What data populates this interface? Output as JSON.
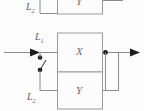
{
  "figure": {
    "type": "block-diagram",
    "background_color": "#fdfdfd",
    "line_color": "#8c8c8c",
    "box_border_color": "#9a9a9a",
    "box_fill_color": "#fcfcfc",
    "label_color": "#5a5a5a",
    "node_color": "#1c1c1c"
  },
  "blocks": [
    {
      "id": "top",
      "label": "Y",
      "note": "partially cropped block at top edge"
    },
    {
      "id": "middle",
      "label": "X",
      "note": "forward path block"
    },
    {
      "id": "bottom",
      "label": "Y",
      "note": "parallel feedback block"
    }
  ],
  "labels": {
    "top_branch": {
      "base": "L",
      "sub": "2"
    },
    "input_node": {
      "base": "L",
      "sub": "1"
    },
    "bottom_branch": {
      "base": "L",
      "sub": "2"
    }
  },
  "signals": {
    "input_arrow": "input-arrow-left",
    "output_arrow": "output-arrow-right",
    "switch": "open-switch"
  }
}
